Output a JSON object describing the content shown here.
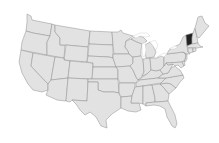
{
  "map": {
    "type": "choropleth",
    "region": "United States (contiguous)",
    "colors": {
      "background": "#ffffff",
      "default_fill": "#e2e2e2",
      "border": "#8e8e8e",
      "highlight_fill": "#222222"
    },
    "highlighted_states": [
      "VT"
    ],
    "states": [
      {
        "id": "WA",
        "name": "Washington",
        "highlighted": false
      },
      {
        "id": "OR",
        "name": "Oregon",
        "highlighted": false
      },
      {
        "id": "CA",
        "name": "California",
        "highlighted": false
      },
      {
        "id": "ID",
        "name": "Idaho",
        "highlighted": false
      },
      {
        "id": "NV",
        "name": "Nevada",
        "highlighted": false
      },
      {
        "id": "MT",
        "name": "Montana",
        "highlighted": false
      },
      {
        "id": "WY",
        "name": "Wyoming",
        "highlighted": false
      },
      {
        "id": "UT",
        "name": "Utah",
        "highlighted": false
      },
      {
        "id": "AZ",
        "name": "Arizona",
        "highlighted": false
      },
      {
        "id": "CO",
        "name": "Colorado",
        "highlighted": false
      },
      {
        "id": "NM",
        "name": "New Mexico",
        "highlighted": false
      },
      {
        "id": "ND",
        "name": "North Dakota",
        "highlighted": false
      },
      {
        "id": "SD",
        "name": "South Dakota",
        "highlighted": false
      },
      {
        "id": "NE",
        "name": "Nebraska",
        "highlighted": false
      },
      {
        "id": "KS",
        "name": "Kansas",
        "highlighted": false
      },
      {
        "id": "OK",
        "name": "Oklahoma",
        "highlighted": false
      },
      {
        "id": "TX",
        "name": "Texas",
        "highlighted": false
      },
      {
        "id": "MN",
        "name": "Minnesota",
        "highlighted": false
      },
      {
        "id": "IA",
        "name": "Iowa",
        "highlighted": false
      },
      {
        "id": "MO",
        "name": "Missouri",
        "highlighted": false
      },
      {
        "id": "AR",
        "name": "Arkansas",
        "highlighted": false
      },
      {
        "id": "LA",
        "name": "Louisiana",
        "highlighted": false
      },
      {
        "id": "WI",
        "name": "Wisconsin",
        "highlighted": false
      },
      {
        "id": "IL",
        "name": "Illinois",
        "highlighted": false
      },
      {
        "id": "MI",
        "name": "Michigan",
        "highlighted": false
      },
      {
        "id": "IN",
        "name": "Indiana",
        "highlighted": false
      },
      {
        "id": "OH",
        "name": "Ohio",
        "highlighted": false
      },
      {
        "id": "KY",
        "name": "Kentucky",
        "highlighted": false
      },
      {
        "id": "TN",
        "name": "Tennessee",
        "highlighted": false
      },
      {
        "id": "MS",
        "name": "Mississippi",
        "highlighted": false
      },
      {
        "id": "AL",
        "name": "Alabama",
        "highlighted": false
      },
      {
        "id": "GA",
        "name": "Georgia",
        "highlighted": false
      },
      {
        "id": "FL",
        "name": "Florida",
        "highlighted": false
      },
      {
        "id": "SC",
        "name": "South Carolina",
        "highlighted": false
      },
      {
        "id": "NC",
        "name": "North Carolina",
        "highlighted": false
      },
      {
        "id": "VA",
        "name": "Virginia",
        "highlighted": false
      },
      {
        "id": "WV",
        "name": "West Virginia",
        "highlighted": false
      },
      {
        "id": "PA",
        "name": "Pennsylvania",
        "highlighted": false
      },
      {
        "id": "NY",
        "name": "New York",
        "highlighted": false
      },
      {
        "id": "VT",
        "name": "Vermont",
        "highlighted": true
      },
      {
        "id": "NH",
        "name": "New Hampshire",
        "highlighted": false
      },
      {
        "id": "ME",
        "name": "Maine",
        "highlighted": false
      },
      {
        "id": "MA",
        "name": "Massachusetts",
        "highlighted": false
      },
      {
        "id": "CT",
        "name": "Connecticut",
        "highlighted": false
      },
      {
        "id": "RI",
        "name": "Rhode Island",
        "highlighted": false
      },
      {
        "id": "NJ",
        "name": "New Jersey",
        "highlighted": false
      },
      {
        "id": "DE",
        "name": "Delaware",
        "highlighted": false
      },
      {
        "id": "MD",
        "name": "Maryland",
        "highlighted": false
      }
    ]
  }
}
